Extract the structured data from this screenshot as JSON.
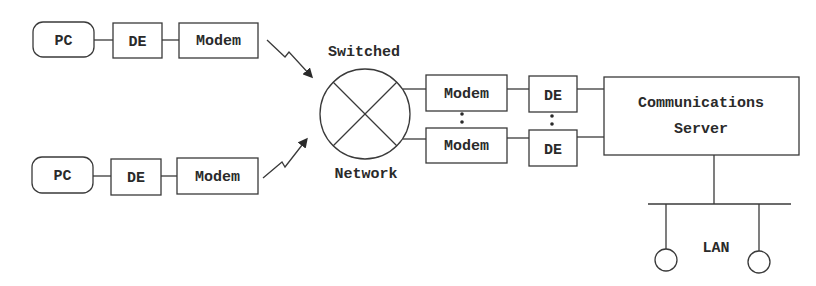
{
  "diagram": {
    "title": "",
    "colors": {
      "stroke": "#3a3a3a",
      "text": "#2a2a2a",
      "background": "#ffffff"
    },
    "remote_sites": [
      {
        "pc": "PC",
        "de": "DE",
        "modem": "Modem"
      },
      {
        "pc": "PC",
        "de": "DE",
        "modem": "Modem"
      }
    ],
    "network": {
      "line1": "Switched",
      "line2": "Network",
      "icon": "switch-circle-x-icon"
    },
    "host_side": {
      "modems": [
        "Modem",
        "Modem"
      ],
      "des": [
        "DE",
        "DE"
      ],
      "ellipsis": "⋮"
    },
    "server": {
      "line1": "Communications",
      "line2": "Server"
    },
    "lan": {
      "label": "LAN",
      "nodes": 2
    },
    "links": {
      "remote_to_network": "wireless-lightning-arrow-icon"
    }
  }
}
